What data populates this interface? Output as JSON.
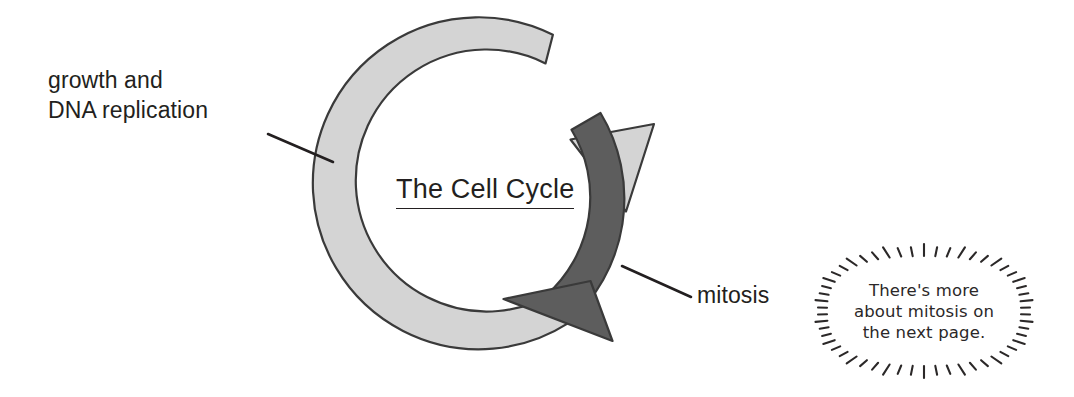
{
  "diagram": {
    "title": "The Cell Cycle",
    "labels": {
      "growth": "growth and\nDNA replication",
      "mitosis": "mitosis"
    },
    "callout": {
      "line1": "There's more",
      "line2": "about mitosis on",
      "line3": "the next page."
    },
    "colors": {
      "interphase_arrow": "#d4d4d4",
      "mitosis_arrow": "#5d5d5d",
      "outline": "#3a3a3a",
      "text": "#231f20",
      "background": "#ffffff"
    },
    "chart_data": {
      "type": "pie",
      "title": "The Cell Cycle",
      "categories": [
        "growth and DNA replication",
        "mitosis"
      ],
      "values": [
        75,
        25
      ],
      "xlabel": "",
      "ylabel": "",
      "legend_position": "callout",
      "annotations": [
        "growth and DNA replication",
        "mitosis",
        "There's more about mitosis on the next page."
      ]
    }
  }
}
